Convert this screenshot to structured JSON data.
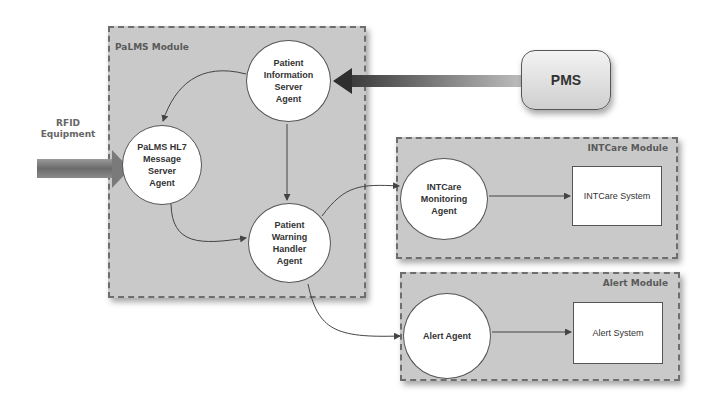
{
  "diagram": {
    "modules": {
      "palms": {
        "title": "PaLMS Module"
      },
      "intcare": {
        "title": "INTCare Module"
      },
      "alert": {
        "title": "Alert Module"
      }
    },
    "agents": {
      "patient_info_server": "Patient\nInformation\nServer\nAgent",
      "hl7_message_server": "PaLMS HL7\nMessage\nServer\nAgent",
      "patient_warning_handler": "Patient\nWarning\nHandler\nAgent",
      "intcare_monitoring": "INTCare\nMonitoring\nAgent",
      "alert_agent": "Alert Agent"
    },
    "systems": {
      "intcare_system": "INTCare System",
      "alert_system": "Alert System",
      "pms": "PMS"
    },
    "external": {
      "rfid": "RFID\nEquipment"
    },
    "edges": [
      {
        "from": "PMS",
        "to": "Patient Information Server Agent",
        "style": "thick-arrow"
      },
      {
        "from": "RFID Equipment",
        "to": "PaLMS HL7 Message Server Agent",
        "style": "thick-arrow"
      },
      {
        "from": "Patient Information Server Agent",
        "to": "PaLMS HL7 Message Server Agent"
      },
      {
        "from": "Patient Information Server Agent",
        "to": "Patient Warning Handler Agent"
      },
      {
        "from": "PaLMS HL7 Message Server Agent",
        "to": "Patient Warning Handler Agent"
      },
      {
        "from": "Patient Warning Handler Agent",
        "to": "INTCare Monitoring Agent"
      },
      {
        "from": "Patient Warning Handler Agent",
        "to": "Alert Agent"
      },
      {
        "from": "INTCare Monitoring Agent",
        "to": "INTCare System"
      },
      {
        "from": "Alert Agent",
        "to": "Alert System"
      }
    ]
  }
}
